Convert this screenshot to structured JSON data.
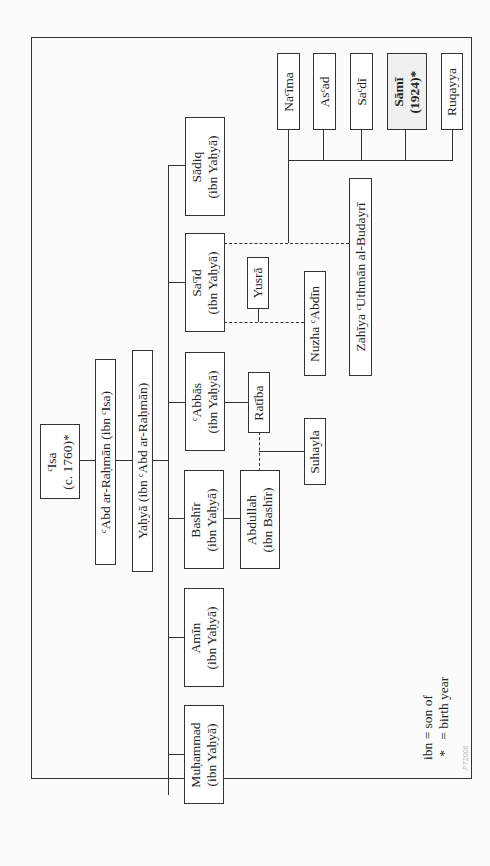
{
  "nodes": {
    "isa": {
      "name": "ᶜIsa",
      "sub": "(c. 1760)*"
    },
    "abd_ar_rahman": {
      "name": "ᶜAbd ar-Raḥmān (ibn ᶜIsa)"
    },
    "yahya": {
      "name": "Yaḥyā (ibn ᶜAbd ar-Raḥmān)"
    },
    "muhammad": {
      "name": "Muḥammad",
      "sub": "(ibn Yaḥyā)"
    },
    "amin": {
      "name": "Amīn",
      "sub": "(ibn Yaḥyā)"
    },
    "bashir": {
      "name": "Bashīr",
      "sub": "(ibn Yaḥyā)"
    },
    "abbas": {
      "name": "ᶜAbbās",
      "sub": "(ibn Yaḥyā)"
    },
    "said": {
      "name": "Saᶜīd",
      "sub": "(ibn Yaḥyā)"
    },
    "sadiq": {
      "name": "Sādiq",
      "sub": "(ibn Yaḥyā)"
    },
    "abdullah": {
      "name": "Abdullah",
      "sub": "(ibn Bashīr)"
    },
    "ratiba": {
      "name": "Ratība"
    },
    "suhayla": {
      "name": "Suhayla"
    },
    "yusra": {
      "name": "Yusrā"
    },
    "nuzha": {
      "name": "Nuzha ᶜAbdīn"
    },
    "zahiya": {
      "name": "Zahīya ᶜUthmān al-Budayrī"
    },
    "naima": {
      "name": "Naᶜīma"
    },
    "asad": {
      "name": "Asᶜad"
    },
    "sadi": {
      "name": "Saᶜdī"
    },
    "sami": {
      "name": "Sāmī",
      "sub": "(1924)*"
    },
    "ruqayya": {
      "name": "Ruqayya"
    }
  },
  "legend": {
    "line1": "ibn = son of",
    "line2": " *   = birth year"
  },
  "watermark": "PT2006"
}
